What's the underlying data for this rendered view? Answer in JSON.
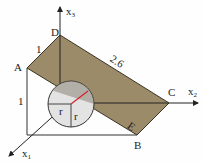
{
  "diagram": {
    "points": {
      "A": "A",
      "B": "B",
      "C": "C",
      "D": "D",
      "E": "E"
    },
    "axes": {
      "x1": "x",
      "x1_sub": "1",
      "x2": "x",
      "x2_sub": "2",
      "x3": "x",
      "x3_sub": "3"
    },
    "lengths": {
      "AD": "1",
      "DC": "2.6",
      "A_height": "1"
    },
    "sphere_labels": {
      "r1": "r",
      "r2": "r"
    },
    "colors": {
      "plane": "#9c8b68",
      "plane_edge": "#3a3326",
      "sphere": "#e4e4e4",
      "radius_line": "#d9232f",
      "axis": "#222222"
    }
  }
}
